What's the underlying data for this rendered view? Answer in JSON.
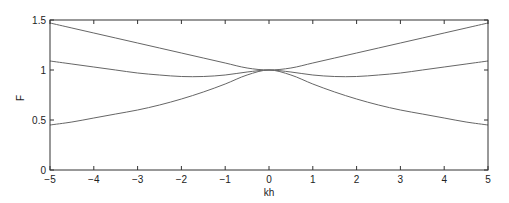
{
  "chart_data": {
    "type": "line",
    "title": "",
    "xlabel": "kh",
    "ylabel": "F",
    "xlim": [
      -5,
      5
    ],
    "ylim": [
      0,
      1.5
    ],
    "xticks": [
      -5,
      -4,
      -3,
      -2,
      -1,
      0,
      1,
      2,
      3,
      4,
      5
    ],
    "xtick_labels": [
      "−5",
      "−4",
      "−3",
      "−2",
      "−1",
      "0",
      "1",
      "2",
      "3",
      "4",
      "5"
    ],
    "yticks": [
      0,
      0.5,
      1,
      1.5
    ],
    "ytick_labels": [
      "0",
      "0.5",
      "1",
      "1.5"
    ],
    "grid": false,
    "legend": null,
    "x": [
      -5,
      -4.5,
      -4,
      -3.5,
      -3,
      -2.5,
      -2,
      -1.5,
      -1,
      -0.5,
      0,
      0.5,
      1,
      1.5,
      2,
      2.5,
      3,
      3.5,
      4,
      4.5,
      5
    ],
    "series": [
      {
        "name": "upper",
        "color": "#666666",
        "values": [
          1.47,
          1.42,
          1.37,
          1.32,
          1.27,
          1.22,
          1.17,
          1.12,
          1.07,
          1.02,
          1.0,
          1.02,
          1.07,
          1.12,
          1.17,
          1.22,
          1.27,
          1.32,
          1.37,
          1.42,
          1.47
        ]
      },
      {
        "name": "middle",
        "color": "#666666",
        "values": [
          1.09,
          1.06,
          1.03,
          1.0,
          0.97,
          0.95,
          0.935,
          0.935,
          0.95,
          0.98,
          1.0,
          0.98,
          0.95,
          0.935,
          0.935,
          0.95,
          0.97,
          1.0,
          1.03,
          1.06,
          1.09
        ]
      },
      {
        "name": "lower",
        "color": "#666666",
        "values": [
          0.45,
          0.48,
          0.52,
          0.56,
          0.6,
          0.65,
          0.71,
          0.78,
          0.86,
          0.95,
          1.0,
          0.95,
          0.86,
          0.78,
          0.71,
          0.65,
          0.6,
          0.56,
          0.52,
          0.48,
          0.45
        ]
      }
    ]
  },
  "layout": {
    "plot_left": 50,
    "plot_right": 488,
    "plot_top": 20,
    "plot_bottom": 170
  }
}
